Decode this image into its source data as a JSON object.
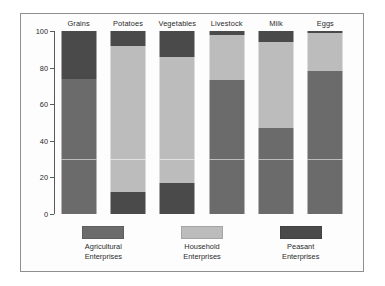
{
  "chart_data": {
    "type": "bar",
    "stacked": true,
    "stack_mode": "percent",
    "title": "",
    "subtitle": "",
    "xlabel": "",
    "ylabel": "",
    "ylim": [
      0,
      100
    ],
    "yticks": [
      0,
      20,
      40,
      60,
      80,
      100
    ],
    "grid": false,
    "legend_position": "bottom",
    "categories": [
      "Grains",
      "Potatoes",
      "Vegetables",
      "Livestock",
      "Milk",
      "Eggs"
    ],
    "series": [
      {
        "name": "Agricultural Enterprises",
        "color": "#6b6b6b",
        "values": [
          74,
          0,
          0,
          73,
          47,
          78
        ]
      },
      {
        "name": "Household Enterprises",
        "color": "#bcbcbc",
        "values": [
          0,
          80,
          69,
          25,
          47,
          21
        ]
      },
      {
        "name": "Peasant Enterprises",
        "color": "#4a4a4a",
        "values": [
          26,
          20,
          31,
          2,
          6,
          1
        ]
      }
    ],
    "stacks": [
      {
        "category": "Grains",
        "segments": [
          {
            "series": "Peasant Enterprises",
            "value": 26,
            "color": "#4a4a4a"
          },
          {
            "series": "Agricultural Enterprises",
            "value": 74,
            "color": "#6b6b6b"
          }
        ]
      },
      {
        "category": "Potatoes",
        "segments": [
          {
            "series": "Peasant Enterprises",
            "value": 8,
            "color": "#4a4a4a"
          },
          {
            "series": "Household Enterprises",
            "value": 80,
            "color": "#bcbcbc"
          },
          {
            "series": "Peasant Enterprises",
            "value": 12,
            "color": "#4a4a4a"
          }
        ]
      },
      {
        "category": "Vegetables",
        "segments": [
          {
            "series": "Peasant Enterprises",
            "value": 14,
            "color": "#4a4a4a"
          },
          {
            "series": "Household Enterprises",
            "value": 69,
            "color": "#bcbcbc"
          },
          {
            "series": "Peasant Enterprises",
            "value": 17,
            "color": "#4a4a4a"
          }
        ]
      },
      {
        "category": "Livestock",
        "segments": [
          {
            "series": "Peasant Enterprises",
            "value": 2,
            "color": "#4a4a4a"
          },
          {
            "series": "Household Enterprises",
            "value": 25,
            "color": "#bcbcbc"
          },
          {
            "series": "Agricultural Enterprises",
            "value": 73,
            "color": "#6b6b6b"
          }
        ]
      },
      {
        "category": "Milk",
        "segments": [
          {
            "series": "Peasant Enterprises",
            "value": 6,
            "color": "#4a4a4a"
          },
          {
            "series": "Household Enterprises",
            "value": 47,
            "color": "#bcbcbc"
          },
          {
            "series": "Agricultural Enterprises",
            "value": 47,
            "color": "#6b6b6b"
          }
        ]
      },
      {
        "category": "Eggs",
        "segments": [
          {
            "series": "Peasant Enterprises",
            "value": 1,
            "color": "#4a4a4a"
          },
          {
            "series": "Household Enterprises",
            "value": 21,
            "color": "#bcbcbc"
          },
          {
            "series": "Agricultural Enterprises",
            "value": 78,
            "color": "#6b6b6b"
          }
        ]
      }
    ],
    "gridline_values": [
      30
    ]
  },
  "legend": [
    {
      "label_line1": "Agricultural",
      "label_line2": "Enterprises",
      "color": "#6b6b6b"
    },
    {
      "label_line1": "Household",
      "label_line2": "Enterprises",
      "color": "#bcbcbc"
    },
    {
      "label_line1": "Peasant",
      "label_line2": "Enterprises",
      "color": "#4a4a4a"
    }
  ]
}
